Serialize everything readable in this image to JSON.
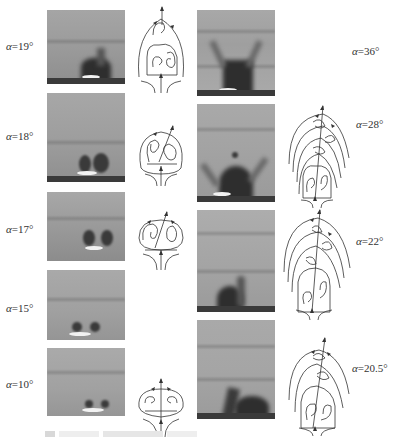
{
  "figure": {
    "left_column": [
      {
        "label_prefix": "α",
        "label_value": "=19°",
        "has_diagram": true,
        "diagram": "two-vortex asymmetric with upper saddle"
      },
      {
        "label_prefix": "α",
        "label_value": "=18°",
        "has_diagram": true,
        "diagram": "asymmetric vortex pair"
      },
      {
        "label_prefix": "α",
        "label_value": "=17°",
        "has_diagram": true,
        "diagram": "near-symmetric vortex pair"
      },
      {
        "label_prefix": "α",
        "label_value": "=15°",
        "has_diagram": false,
        "diagram": ""
      },
      {
        "label_prefix": "α",
        "label_value": "=10°",
        "has_diagram": true,
        "diagram": "symmetric vortex pair"
      }
    ],
    "right_column": [
      {
        "label_prefix": "α",
        "label_value": "=36°",
        "has_diagram": false,
        "diagram": ""
      },
      {
        "label_prefix": "α",
        "label_value": "=28°",
        "has_diagram": true,
        "diagram": "multi-vortex staggered stack"
      },
      {
        "label_prefix": "α",
        "label_value": "=22°",
        "has_diagram": true,
        "diagram": "three-level staggered vortices"
      },
      {
        "label_prefix": "α",
        "label_value": "=20.5°",
        "has_diagram": true,
        "diagram": "two-level staggered vortices"
      }
    ],
    "caption": "(cropped, illegible)"
  }
}
